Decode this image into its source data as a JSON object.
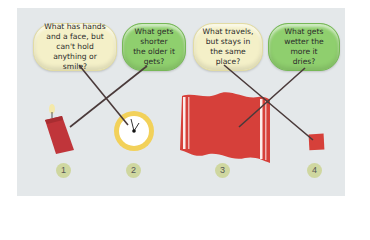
{
  "activity": {
    "type": "riddle-matching",
    "colors": {
      "background": "#e4e8ea",
      "bubble_yellow": "#f4f0c8",
      "bubble_green": "#8fcf6e",
      "line": "#4a3a3a",
      "candle": "#c0353a",
      "clock_ring": "#f2d15a",
      "towel": "#d6403a",
      "stamp": "#d6403a",
      "number_badge": "#cfd7a0"
    },
    "riddles": [
      {
        "id": 1,
        "text": "What has hands and a face, but can't hold anything or smile?",
        "color": "yellow",
        "answer": 2
      },
      {
        "id": 2,
        "text": "What gets shorter the older it gets?",
        "color": "green",
        "answer": 1
      },
      {
        "id": 3,
        "text": "What travels, but stays in the same place?",
        "color": "yellow",
        "answer": 4
      },
      {
        "id": 4,
        "text": "What gets wetter the more it dries?",
        "color": "green",
        "answer": 3
      }
    ],
    "objects": [
      {
        "number": "1",
        "name": "candle",
        "icon": "candle-icon"
      },
      {
        "number": "2",
        "name": "clock",
        "icon": "clock-icon"
      },
      {
        "number": "3",
        "name": "towel",
        "icon": "towel-icon"
      },
      {
        "number": "4",
        "name": "stamp",
        "icon": "stamp-icon"
      }
    ]
  }
}
